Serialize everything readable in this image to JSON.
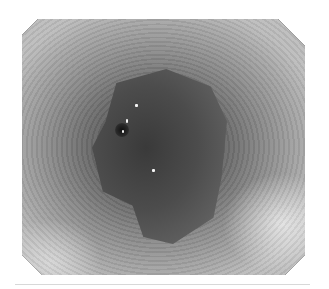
{
  "image": {
    "description": "Grayscale endoscopic view of a tubular lumen with a central darker irregular mucosal region converging to a central fold",
    "colors": {
      "background": "#ffffff",
      "mask": "#000000",
      "wall_light": "#bdbdbd",
      "wall_mid": "#8e8e8e",
      "lesion_dark": "#3a3a3a"
    }
  }
}
